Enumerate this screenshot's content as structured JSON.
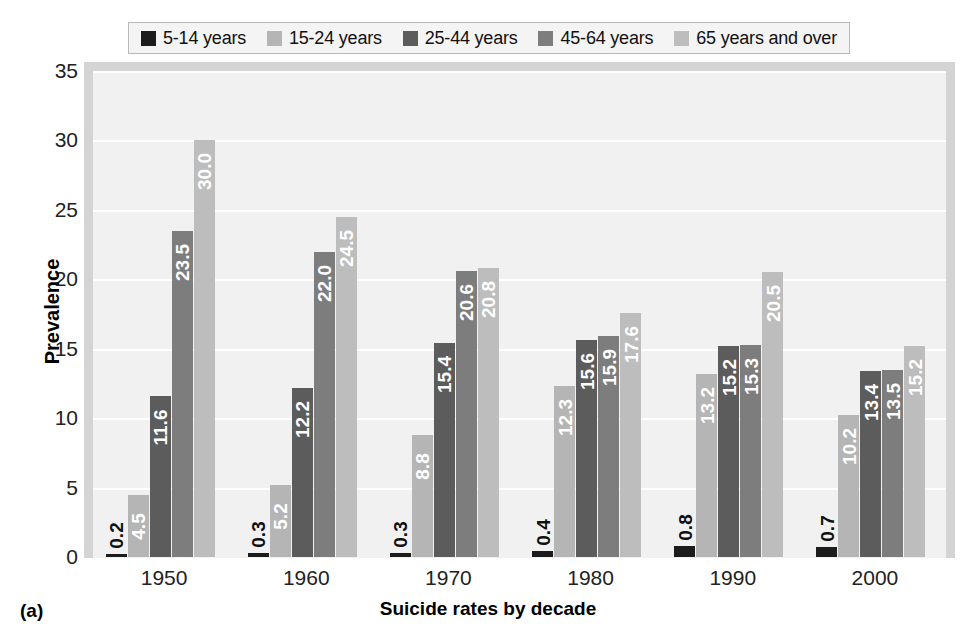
{
  "figure": {
    "label": "(a)",
    "xlabel": "Suicide rates by decade",
    "ylabel": "Prevalence"
  },
  "legend": {
    "items": [
      {
        "label": "5-14 years",
        "color": "#1c1c1c"
      },
      {
        "label": "15-24 years",
        "color": "#b5b5b5"
      },
      {
        "label": "25-44 years",
        "color": "#5c5c5c"
      },
      {
        "label": "45-64 years",
        "color": "#7d7d7d"
      },
      {
        "label": "65 years and over",
        "color": "#bdbdbd"
      }
    ]
  },
  "chart_data": {
    "type": "bar",
    "title": "",
    "xlabel": "Suicide rates by decade",
    "ylabel": "Prevalence",
    "ylim": [
      0,
      35
    ],
    "yticks": [
      0,
      5,
      10,
      15,
      20,
      25,
      30,
      35
    ],
    "grid": true,
    "legend_position": "top",
    "categories": [
      "1950",
      "1960",
      "1970",
      "1980",
      "1990",
      "2000"
    ],
    "series": [
      {
        "name": "5-14 years",
        "color": "#1c1c1c",
        "values": [
          0.2,
          0.3,
          0.3,
          0.4,
          0.8,
          0.7
        ]
      },
      {
        "name": "15-24 years",
        "color": "#b5b5b5",
        "values": [
          4.5,
          5.2,
          8.8,
          12.3,
          13.2,
          10.2
        ]
      },
      {
        "name": "25-44 years",
        "color": "#5c5c5c",
        "values": [
          11.6,
          12.2,
          15.4,
          15.6,
          15.2,
          13.4
        ]
      },
      {
        "name": "45-64 years",
        "color": "#7d7d7d",
        "values": [
          23.5,
          22.0,
          20.6,
          15.9,
          15.3,
          13.5
        ]
      },
      {
        "name": "65 years and over",
        "color": "#bdbdbd",
        "values": [
          30.0,
          24.5,
          20.8,
          17.6,
          20.5,
          15.2
        ]
      }
    ],
    "value_labels": [
      [
        "0.2",
        "4.5",
        "11.6",
        "23.5",
        "30.0"
      ],
      [
        "0.3",
        "5.2",
        "12.2",
        "22.0",
        "24.5"
      ],
      [
        "0.3",
        "8.8",
        "15.4",
        "20.6",
        "20.8"
      ],
      [
        "0.4",
        "12.3",
        "15.6",
        "15.9",
        "17.6"
      ],
      [
        "0.8",
        "13.2",
        "15.2",
        "15.3",
        "20.5"
      ],
      [
        "0.7",
        "10.2",
        "13.4",
        "13.5",
        "15.2"
      ]
    ]
  },
  "colors": {
    "plot_background": "#f1f1f1",
    "plot_border": "#d4d4d4",
    "gridline": "#ffffff",
    "page_background": "#ffffff"
  }
}
